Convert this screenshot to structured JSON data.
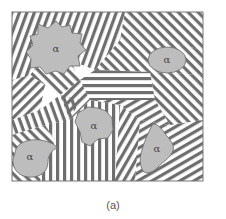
{
  "figure": {
    "caption": "(a)",
    "frame": {
      "x": 12,
      "y": 12,
      "width": 191,
      "height": 169
    },
    "colors": {
      "background": "#ffffff",
      "lamella": "#6e6e6e",
      "grain_fill": "#bdbdbd",
      "grain_stroke": "#6a6a6a",
      "frame": "#777777",
      "label": "#444444"
    },
    "grains": [
      {
        "id": "grain-top-left",
        "label": "α",
        "cx": 56,
        "cy": 49
      },
      {
        "id": "grain-top-right",
        "label": "α",
        "cx": 167,
        "cy": 60
      },
      {
        "id": "grain-center",
        "label": "α",
        "cx": 94,
        "cy": 126
      },
      {
        "id": "grain-bottom-left",
        "label": "α",
        "cx": 30,
        "cy": 157
      },
      {
        "id": "grain-bottom-right",
        "label": "α",
        "cx": 158,
        "cy": 149
      }
    ]
  }
}
